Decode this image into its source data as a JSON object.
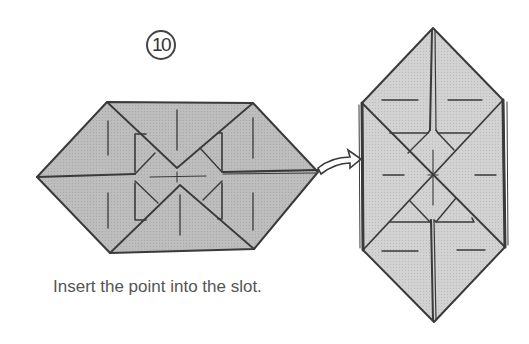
{
  "step": {
    "number": "10"
  },
  "caption": "Insert the point into the slot.",
  "colors": {
    "paper_fill": "#b9b9b9",
    "paper_fill_light": "#d4d4d4",
    "line": "#3a3a3a",
    "background": "#ffffff"
  },
  "figures": [
    {
      "name": "before",
      "description": "Horizontal hexagon folded unit with point on right side"
    },
    {
      "name": "after",
      "description": "Vertical hexagon with point inserted into slot on left side"
    }
  ],
  "arrow": {
    "type": "insert-arrow",
    "from": "before-right-point",
    "to": "after-left-slot"
  }
}
